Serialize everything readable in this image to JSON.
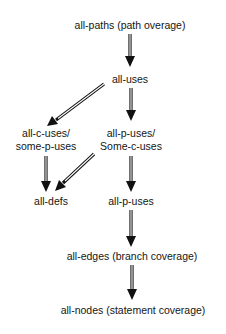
{
  "diagram": {
    "type": "subsumption hierarchy",
    "nodes": [
      {
        "id": "all-paths",
        "label": "all-paths (path overage)"
      },
      {
        "id": "all-uses",
        "label": "all-uses"
      },
      {
        "id": "all-c-uses",
        "label_line1": "all-c-uses/",
        "label_line2": "some-p-uses"
      },
      {
        "id": "all-p-uses-some-c",
        "label_line1": "all-p-uses/",
        "label_line2": "Some-c-uses"
      },
      {
        "id": "all-defs",
        "label": "all-defs"
      },
      {
        "id": "all-p-uses",
        "label": "all-p-uses"
      },
      {
        "id": "all-edges",
        "label": "all-edges (branch coverage)"
      },
      {
        "id": "all-nodes",
        "label": "all-nodes (statement coverage)"
      }
    ],
    "edges": [
      {
        "from": "all-paths",
        "to": "all-uses"
      },
      {
        "from": "all-uses",
        "to": "all-c-uses"
      },
      {
        "from": "all-uses",
        "to": "all-p-uses-some-c"
      },
      {
        "from": "all-c-uses",
        "to": "all-defs"
      },
      {
        "from": "all-p-uses-some-c",
        "to": "all-defs"
      },
      {
        "from": "all-p-uses-some-c",
        "to": "all-p-uses"
      },
      {
        "from": "all-p-uses",
        "to": "all-edges"
      },
      {
        "from": "all-edges",
        "to": "all-nodes"
      }
    ],
    "colors": {
      "text": "#151515",
      "arrow": "#111111",
      "background": "#ffffff"
    }
  }
}
